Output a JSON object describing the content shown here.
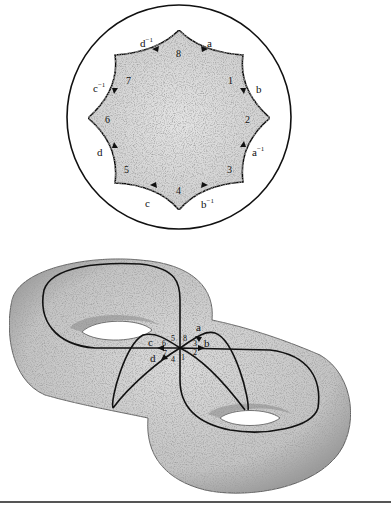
{
  "figure": {
    "top_panel": {
      "description": "Hyperbolic octagon inscribed in the Poincaré disk",
      "vertex_labels": [
        "1",
        "2",
        "3",
        "4",
        "5",
        "6",
        "7",
        "8"
      ],
      "edge_labels": {
        "e_8_1": {
          "base": "a",
          "sup": ""
        },
        "e_1_2": {
          "base": "b",
          "sup": ""
        },
        "e_2_3": {
          "base": "a",
          "sup": "−1"
        },
        "e_3_4": {
          "base": "b",
          "sup": "−1"
        },
        "e_4_5": {
          "base": "c",
          "sup": ""
        },
        "e_5_6": {
          "base": "d",
          "sup": ""
        },
        "e_6_7": {
          "base": "c",
          "sup": "−1"
        },
        "e_7_8": {
          "base": "d",
          "sup": "−1"
        }
      }
    },
    "bottom_panel": {
      "description": "Genus-2 surface (double torus) with four loops a, b, c, d through one vertex",
      "loop_labels": [
        "a",
        "b",
        "c",
        "d"
      ],
      "corner_labels": [
        "1",
        "2",
        "3",
        "4",
        "5",
        "6",
        "7",
        "8"
      ]
    },
    "colors": {
      "ink": "#111111",
      "fill_gray": "#c8c8c8",
      "background": "#ffffff",
      "rule": "#555555"
    }
  }
}
